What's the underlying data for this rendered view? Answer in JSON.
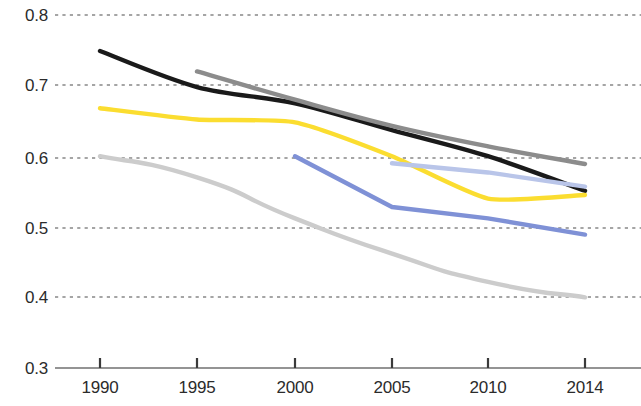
{
  "chart_data": {
    "type": "line",
    "title": "",
    "subtitle": "",
    "xlabel": "",
    "ylabel": "",
    "x": [
      1990,
      1995,
      2000,
      2005,
      2010,
      2014
    ],
    "x_tick_labels": [
      "1990",
      "1995",
      "2000",
      "2005",
      "2010",
      "2014"
    ],
    "y_tick_labels": [
      "0.8",
      "0.7",
      "0.6",
      "0.5",
      "0.4",
      "0.3"
    ],
    "y_ticks": [
      0.8,
      0.7,
      0.6,
      0.5,
      0.4,
      0.3
    ],
    "ylim": [
      0.3,
      0.8
    ],
    "xlim": [
      1988,
      2016
    ],
    "grid": "horizontal-dashed",
    "legend": "none",
    "series": [
      {
        "name": "black-line",
        "color": "#1a1a1a",
        "x": [
          1990,
          1995,
          2000,
          2005,
          2010,
          2014
        ],
        "values": [
          0.749,
          0.698,
          0.675,
          0.637,
          0.6,
          0.551
        ]
      },
      {
        "name": "dark-gray-line",
        "color": "#8c8c8c",
        "x": [
          1995,
          2000,
          2005,
          2010,
          2014
        ],
        "values": [
          0.72,
          0.68,
          0.643,
          0.614,
          0.589
        ]
      },
      {
        "name": "yellow-line",
        "color": "#fbdd30",
        "x": [
          1990,
          1995,
          2000,
          2005,
          2010,
          2014
        ],
        "values": [
          0.668,
          0.652,
          0.648,
          0.6,
          0.54,
          0.545
        ]
      },
      {
        "name": "light-gray-line",
        "color": "#cccccc",
        "x": [
          1990,
          1995,
          2000,
          2005,
          2010,
          2014
        ],
        "values": [
          0.6,
          0.57,
          0.512,
          0.462,
          0.422,
          0.4
        ]
      },
      {
        "name": "medium-blue-line",
        "color": "#7f91d6",
        "x": [
          2000,
          2005,
          2010,
          2014
        ],
        "values": [
          0.6,
          0.528,
          0.512,
          0.489
        ]
      },
      {
        "name": "light-blue-line",
        "color": "#b9c5e9",
        "x": [
          2005,
          2010,
          2014
        ],
        "values": [
          0.59,
          0.577,
          0.557
        ]
      }
    ],
    "axis_color": "#666666",
    "gridline_color": "#4d4d4d"
  }
}
